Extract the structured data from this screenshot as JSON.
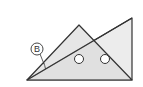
{
  "diagram": {
    "type": "geometry",
    "colors": {
      "background": "#ffffff",
      "stroke": "#333333",
      "fill_light": "#ececec",
      "fill_overlap": "#d6d6d6",
      "hole_fill": "#ffffff"
    },
    "triangle_a": {
      "name": "isosceles-set-square",
      "points": [
        [
          27,
          80
        ],
        [
          79,
          25
        ],
        [
          132,
          80
        ]
      ]
    },
    "triangle_b": {
      "name": "right-angle-set-square",
      "points": [
        [
          27,
          80
        ],
        [
          132,
          18
        ],
        [
          132,
          80
        ]
      ]
    },
    "holes": [
      {
        "cx": 79,
        "cy": 59,
        "r": 4.5
      },
      {
        "cx": 105,
        "cy": 59,
        "r": 4.5
      }
    ],
    "angle_label": {
      "text": "B",
      "cx": 37,
      "cy": 49,
      "r": 6,
      "leader_to": [
        44,
        65
      ]
    }
  }
}
